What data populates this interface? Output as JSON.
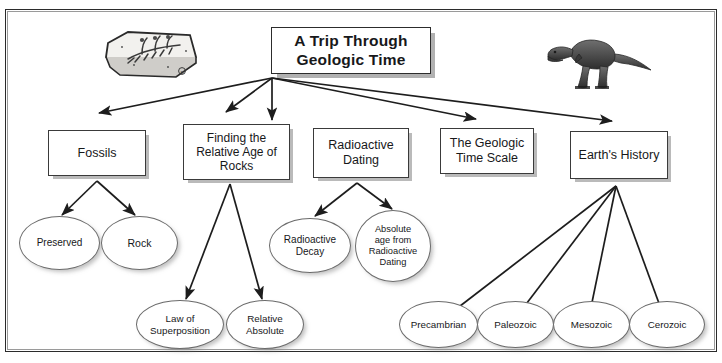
{
  "diagram": {
    "type": "concept-map",
    "title": "A Trip Through Geologic Time",
    "frame": {
      "border_color": "#2b2b2b",
      "background": "#ffffff"
    },
    "root": {
      "id": "title",
      "label": "A Trip Through Geologic Time"
    },
    "level1": [
      {
        "id": "fossils",
        "label": "Fossils"
      },
      {
        "id": "relage",
        "label": "Finding the Relative Age of Rocks"
      },
      {
        "id": "raddating",
        "label": "Radioactive Dating"
      },
      {
        "id": "geotime",
        "label": "The Geologic Time Scale"
      },
      {
        "id": "earthhist",
        "label": "Earth's History"
      }
    ],
    "level2": [
      {
        "id": "preserved",
        "label": "Preserved",
        "parent": "fossils"
      },
      {
        "id": "rock",
        "label": "Rock",
        "parent": "fossils"
      },
      {
        "id": "lawsuper",
        "label": "Law of Superposition",
        "parent": "relage"
      },
      {
        "id": "relabs",
        "label": "Relative Absolute",
        "parent": "relage"
      },
      {
        "id": "raddecay",
        "label": "Radioactive Decay",
        "parent": "raddating"
      },
      {
        "id": "absage",
        "label": "Absolute age from Radioactive Dating",
        "parent": "raddating"
      },
      {
        "id": "precambrian",
        "label": "Precambrian",
        "parent": "earthhist"
      },
      {
        "id": "paleozoic",
        "label": "Paleozoic",
        "parent": "earthhist"
      },
      {
        "id": "mesozoic",
        "label": "Mesozoic",
        "parent": "earthhist"
      },
      {
        "id": "cerozoic",
        "label": "Cerozoic",
        "parent": "earthhist"
      }
    ],
    "images": [
      {
        "id": "fossil-illustration",
        "name": "fossil-rock-icon",
        "description": "fossil slab with plant imprint"
      },
      {
        "id": "dinosaur-illustration",
        "name": "dinosaur-icon",
        "description": "tyrannosaurus rex facing left"
      }
    ],
    "labels": {
      "title_line1": "A Trip Through",
      "title_line2": "Geologic Time",
      "relage_line1": "Finding the",
      "relage_line2": "Relative Age of",
      "relage_line3": "Rocks",
      "raddating_line1": "Radioactive",
      "raddating_line2": "Dating",
      "geotime_line1": "The Geologic",
      "geotime_line2": "Time Scale",
      "earthhist_line1": "Earth's History",
      "fossils_line1": "Fossils",
      "preserved_line1": "Preserved",
      "rock_line1": "Rock",
      "raddecay_line1": "Radioactive",
      "raddecay_line2": "Decay",
      "absage_line1": "Absolute",
      "absage_line2": "age from",
      "absage_line3": "Radioactive",
      "absage_line4": "Dating",
      "lawsuper_line1": "Law of",
      "lawsuper_line2": "Superposition",
      "relabs_line1": "Relative",
      "relabs_line2": "Absolute",
      "precambrian_line1": "Precambrian",
      "paleozoic_line1": "Paleozoic",
      "mesozoic_line1": "Mesozoic",
      "cerozoic_line1": "Cerozoic"
    }
  }
}
